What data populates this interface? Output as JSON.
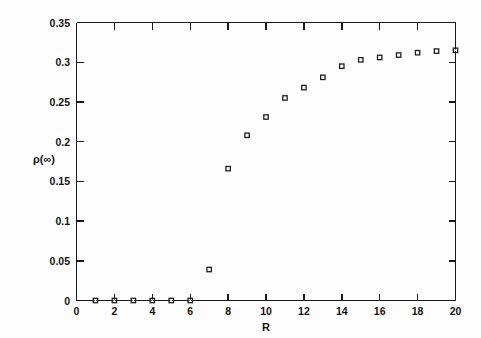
{
  "chart_data": {
    "type": "scatter",
    "title": "",
    "xlabel": "R",
    "ylabel": "ρ(∞)",
    "xlim": [
      0,
      20
    ],
    "ylim": [
      0,
      0.35
    ],
    "grid": false,
    "legend": null,
    "marker": "open-square",
    "x": [
      1,
      2,
      3,
      4,
      5,
      6,
      7,
      8,
      9,
      10,
      11,
      12,
      13,
      14,
      15,
      16,
      17,
      18,
      19,
      20
    ],
    "y": [
      0,
      0,
      0,
      0,
      0,
      0,
      0.039,
      0.166,
      0.208,
      0.231,
      0.255,
      0.268,
      0.281,
      0.295,
      0.303,
      0.306,
      0.309,
      0.312,
      0.314,
      0.315
    ],
    "xticks": [
      0,
      2,
      4,
      6,
      8,
      10,
      12,
      14,
      16,
      18,
      20
    ],
    "xtick_labels": [
      "0",
      "2",
      "4",
      "6",
      "8",
      "10",
      "12",
      "14",
      "16",
      "18",
      "20"
    ],
    "yticks": [
      0,
      0.05,
      0.1,
      0.15,
      0.2,
      0.25,
      0.3,
      0.35
    ],
    "ytick_labels": [
      "0",
      "0.05",
      "0.1",
      "0.15",
      "0.2",
      "0.25",
      "0.3",
      "0.35"
    ],
    "x_minor_ticks": [
      1,
      3,
      5,
      7,
      9,
      11,
      13,
      15,
      17,
      19
    ],
    "series_name": "rho-infinity-vs-R",
    "colors": {
      "axis": "#191919",
      "marker": "#1f1f1f",
      "background": "#fdfdfd",
      "text": "#131313"
    }
  },
  "figure": {
    "caption": ""
  }
}
